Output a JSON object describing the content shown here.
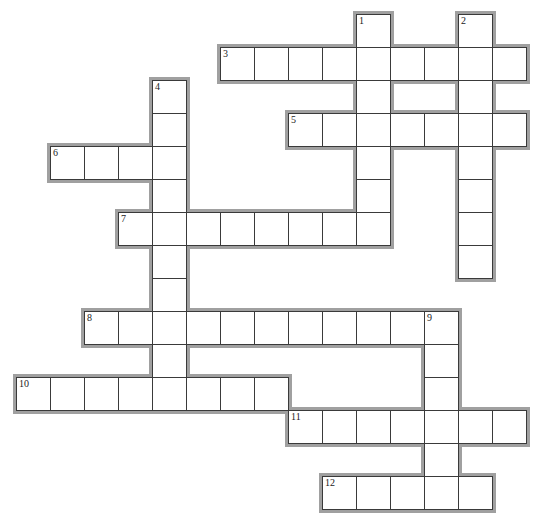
{
  "puzzle": {
    "grid": {
      "origin_x": 16,
      "origin_y": 14,
      "cell_w": 34,
      "cell_h": 33,
      "cols": 15,
      "rows": 15
    },
    "colors": {
      "cell_border": "#3a3a3a",
      "outer_shadow": "#a0a0a0",
      "cell_fill": "#ffffff"
    },
    "words": [
      {
        "number": "1",
        "direction": "down",
        "row": 0,
        "col": 10,
        "length": 7
      },
      {
        "number": "2",
        "direction": "down",
        "row": 0,
        "col": 13,
        "length": 8
      },
      {
        "number": "3",
        "direction": "across",
        "row": 1,
        "col": 6,
        "length": 9
      },
      {
        "number": "4",
        "direction": "down",
        "row": 2,
        "col": 4,
        "length": 10
      },
      {
        "number": "5",
        "direction": "across",
        "row": 3,
        "col": 8,
        "length": 7
      },
      {
        "number": "6",
        "direction": "across",
        "row": 4,
        "col": 1,
        "length": 4
      },
      {
        "number": "7",
        "direction": "across",
        "row": 6,
        "col": 3,
        "length": 8
      },
      {
        "number": "8",
        "direction": "across",
        "row": 9,
        "col": 2,
        "length": 11
      },
      {
        "number": "9",
        "direction": "down",
        "row": 9,
        "col": 12,
        "length": 6
      },
      {
        "number": "10",
        "direction": "across",
        "row": 11,
        "col": 0,
        "length": 8
      },
      {
        "number": "11",
        "direction": "across",
        "row": 12,
        "col": 8,
        "length": 7
      },
      {
        "number": "12",
        "direction": "across",
        "row": 14,
        "col": 9,
        "length": 5
      }
    ],
    "cell_values": {}
  }
}
